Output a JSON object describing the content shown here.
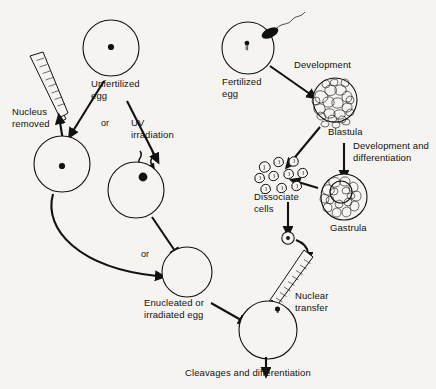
{
  "figure": {
    "background_color": "#f6f4f0",
    "ink_color": "#111111",
    "width": 436,
    "height": 389
  },
  "labels": {
    "unfertilized_egg": "Unfertilized\negg",
    "nucleus_removed": "Nucleus\nremoved",
    "or_1": "or",
    "or_2": "or",
    "uv_irradiation": "UV\nirradiation",
    "enucleated_or_irradiated_egg": "Enucleated or\nirradiated egg",
    "fertilized_egg": "Fertilized\negg",
    "development": "Development",
    "blastula": "Blastula",
    "development_and_differentiation": "Development and\ndifferentiation",
    "gastrula": "Gastrula",
    "dissociate_cells": "Dissociate\ncells",
    "nuclear_transfer": "Nuclear\ntransfer",
    "cleavages_and_differentiation": "Cleavages and differentiation"
  },
  "structures": {
    "unfertilized_egg": {
      "cx": 111,
      "cy": 48,
      "r": 28,
      "has_nucleus": true
    },
    "enucleation_egg": {
      "cx": 62,
      "cy": 164,
      "r": 28,
      "has_nucleus": true
    },
    "uv_egg": {
      "cx": 136,
      "cy": 190,
      "r": 28,
      "has_nucleus": true
    },
    "recipient_egg": {
      "cx": 187,
      "cy": 272,
      "r": 25,
      "has_nucleus": false
    },
    "fertilized_egg": {
      "cx": 248,
      "cy": 48,
      "r": 26,
      "has_nucleus": true,
      "has_sperm": true
    },
    "blastula": {
      "cx": 335,
      "cy": 100,
      "r": 22,
      "type": "solid-cell-mass"
    },
    "gastrula": {
      "cx": 344,
      "cy": 197,
      "outer_r": 23,
      "inner_r": 11,
      "type": "ring-cell-mass"
    },
    "dissociated_cells": {
      "count": 10,
      "region": "x 255-312, y 157-192"
    },
    "donor_cell": {
      "cx": 288,
      "cy": 238,
      "r": 6,
      "has_nucleus": true
    },
    "reconstructed_egg": {
      "cx": 268,
      "cy": 330,
      "r": 29,
      "has_nucleus": true
    }
  },
  "icons": {
    "micropipette_enucleation": "micropipette-icon",
    "micropipette_transfer": "micropipette-icon",
    "sperm": "sperm-icon",
    "uv_rays": "uv-ray-icon"
  }
}
